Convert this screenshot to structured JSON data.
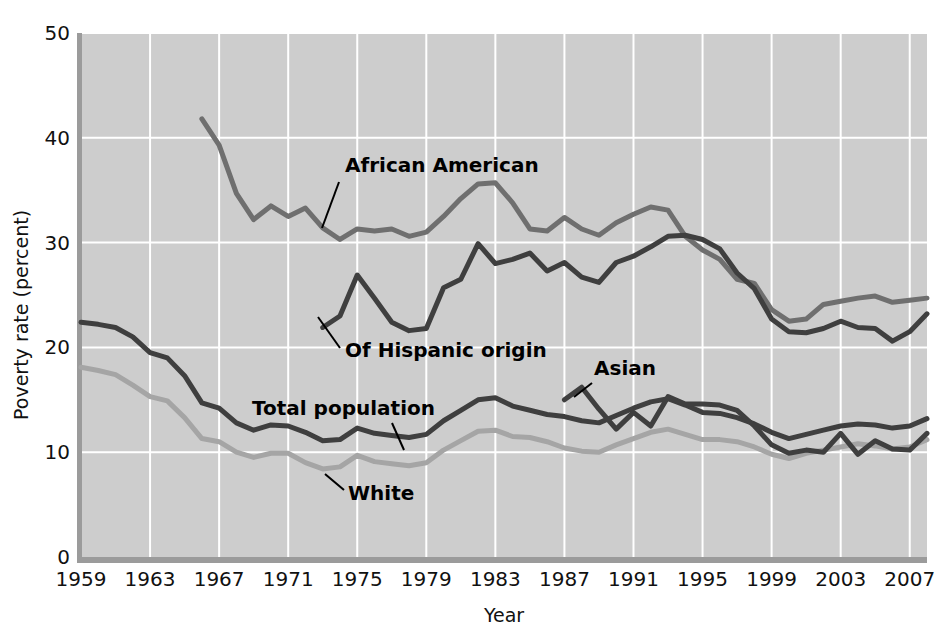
{
  "chart_data": {
    "type": "line",
    "title": "",
    "xlabel": "Year",
    "ylabel": "Poverty rate (percent)",
    "xlim": [
      1959,
      2008
    ],
    "ylim": [
      0,
      50
    ],
    "ytick_labels": [
      "0",
      "10",
      "20",
      "30",
      "40",
      "50"
    ],
    "yticks": [
      0,
      10,
      20,
      30,
      40,
      50
    ],
    "xtick_labels": [
      "1959",
      "1963",
      "1967",
      "1971",
      "1975",
      "1979",
      "1983",
      "1987",
      "1991",
      "1995",
      "1999",
      "2003",
      "2007"
    ],
    "xticks": [
      1959,
      1963,
      1967,
      1971,
      1975,
      1979,
      1983,
      1987,
      1991,
      1995,
      1999,
      2003,
      2007
    ],
    "grid": true,
    "grid_color": "#ffffff",
    "plot_background": "#cdcdcd",
    "legend_position": "inline-annotations",
    "series": [
      {
        "name": "African American",
        "color": "#6f6f6f",
        "label_text": "African American",
        "x": [
          1966,
          1967,
          1968,
          1969,
          1970,
          1971,
          1972,
          1973,
          1974,
          1975,
          1976,
          1977,
          1978,
          1979,
          1980,
          1981,
          1982,
          1983,
          1984,
          1985,
          1986,
          1987,
          1988,
          1989,
          1990,
          1991,
          1992,
          1993,
          1994,
          1995,
          1996,
          1997,
          1998,
          1999,
          2000,
          2001,
          2002,
          2003,
          2004,
          2005,
          2006,
          2007,
          2008
        ],
        "values": [
          41.8,
          39.3,
          34.7,
          32.2,
          33.5,
          32.5,
          33.3,
          31.4,
          30.3,
          31.3,
          31.1,
          31.3,
          30.6,
          31.0,
          32.5,
          34.2,
          35.6,
          35.7,
          33.8,
          31.3,
          31.1,
          32.4,
          31.3,
          30.7,
          31.9,
          32.7,
          33.4,
          33.1,
          30.6,
          29.3,
          28.4,
          26.5,
          26.1,
          23.6,
          22.5,
          22.7,
          24.1,
          24.4,
          24.7,
          24.9,
          24.3,
          24.5,
          24.7
        ]
      },
      {
        "name": "Of Hispanic origin",
        "color": "#3f3f3f",
        "label_text": "Of Hispanic origin",
        "x": [
          1973,
          1974,
          1975,
          1976,
          1977,
          1978,
          1979,
          1980,
          1981,
          1982,
          1983,
          1984,
          1985,
          1986,
          1987,
          1988,
          1989,
          1990,
          1991,
          1992,
          1993,
          1994,
          1995,
          1996,
          1997,
          1998,
          1999,
          2000,
          2001,
          2002,
          2003,
          2004,
          2005,
          2006,
          2007,
          2008
        ],
        "values": [
          21.9,
          23.0,
          26.9,
          24.7,
          22.4,
          21.6,
          21.8,
          25.7,
          26.5,
          29.9,
          28.0,
          28.4,
          29.0,
          27.3,
          28.1,
          26.7,
          26.2,
          28.1,
          28.7,
          29.6,
          30.6,
          30.7,
          30.3,
          29.4,
          27.1,
          25.6,
          22.7,
          21.5,
          21.4,
          21.8,
          22.5,
          21.9,
          21.8,
          20.6,
          21.5,
          23.2
        ]
      },
      {
        "name": "Total population",
        "color": "#3f3f3f",
        "label_text": "Total population",
        "x": [
          1959,
          1960,
          1961,
          1962,
          1963,
          1964,
          1965,
          1966,
          1967,
          1968,
          1969,
          1970,
          1971,
          1972,
          1973,
          1974,
          1975,
          1976,
          1977,
          1978,
          1979,
          1980,
          1981,
          1982,
          1983,
          1984,
          1985,
          1986,
          1987,
          1988,
          1989,
          1990,
          1991,
          1992,
          1993,
          1994,
          1995,
          1996,
          1997,
          1998,
          1999,
          2000,
          2001,
          2002,
          2003,
          2004,
          2005,
          2006,
          2007,
          2008
        ],
        "values": [
          22.4,
          22.2,
          21.9,
          21.0,
          19.5,
          19.0,
          17.3,
          14.7,
          14.2,
          12.8,
          12.1,
          12.6,
          12.5,
          11.9,
          11.1,
          11.2,
          12.3,
          11.8,
          11.6,
          11.4,
          11.7,
          13.0,
          14.0,
          15.0,
          15.2,
          14.4,
          14.0,
          13.6,
          13.4,
          13.0,
          12.8,
          13.5,
          14.2,
          14.8,
          15.1,
          14.5,
          13.8,
          13.7,
          13.3,
          12.7,
          11.9,
          11.3,
          11.7,
          12.1,
          12.5,
          12.7,
          12.6,
          12.3,
          12.5,
          13.2
        ]
      },
      {
        "name": "White",
        "color": "#a5a5a5",
        "label_text": "White",
        "x": [
          1959,
          1960,
          1961,
          1962,
          1963,
          1964,
          1965,
          1966,
          1967,
          1968,
          1969,
          1970,
          1971,
          1972,
          1973,
          1974,
          1975,
          1976,
          1977,
          1978,
          1979,
          1980,
          1981,
          1982,
          1983,
          1984,
          1985,
          1986,
          1987,
          1988,
          1989,
          1990,
          1991,
          1992,
          1993,
          1994,
          1995,
          1996,
          1997,
          1998,
          1999,
          2000,
          2001,
          2002,
          2003,
          2004,
          2005,
          2006,
          2007,
          2008
        ],
        "values": [
          18.1,
          17.8,
          17.4,
          16.4,
          15.3,
          14.9,
          13.3,
          11.3,
          11.0,
          10.0,
          9.5,
          9.9,
          9.9,
          9.0,
          8.4,
          8.6,
          9.7,
          9.1,
          8.9,
          8.7,
          9.0,
          10.2,
          11.1,
          12.0,
          12.1,
          11.5,
          11.4,
          11.0,
          10.4,
          10.1,
          10.0,
          10.7,
          11.3,
          11.9,
          12.2,
          11.7,
          11.2,
          11.2,
          11.0,
          10.5,
          9.8,
          9.4,
          9.9,
          10.2,
          10.5,
          10.8,
          10.6,
          10.3,
          10.5,
          11.2
        ]
      },
      {
        "name": "Asian",
        "color": "#3f3f3f",
        "label_text": "Asian",
        "x": [
          1987,
          1988,
          1989,
          1990,
          1991,
          1992,
          1993,
          1994,
          1995,
          1996,
          1997,
          1998,
          1999,
          2000,
          2001,
          2002,
          2003,
          2004,
          2005,
          2006,
          2007,
          2008
        ],
        "values": [
          15.0,
          16.2,
          14.1,
          12.2,
          13.8,
          12.5,
          15.3,
          14.6,
          14.6,
          14.5,
          14.0,
          12.5,
          10.7,
          9.9,
          10.2,
          10.0,
          11.8,
          9.8,
          11.1,
          10.3,
          10.2,
          11.8
        ]
      }
    ],
    "annotations": [
      {
        "name": "african-american-label",
        "text": "African American",
        "text_x": 345,
        "text_y": 172,
        "leader": {
          "x1": 339,
          "y1": 182,
          "x2": 322,
          "y2": 228
        }
      },
      {
        "name": "of-hispanic-origin-label",
        "text": "Of Hispanic origin",
        "text_x": 345,
        "text_y": 357,
        "leader": {
          "x1": 340,
          "y1": 348,
          "x2": 318,
          "y2": 317
        }
      },
      {
        "name": "total-population-label",
        "text": "Total population",
        "text_x": 252,
        "text_y": 415,
        "leader": {
          "x1": 392,
          "y1": 423,
          "x2": 404,
          "y2": 450
        }
      },
      {
        "name": "white-label",
        "text": "White",
        "text_x": 348,
        "text_y": 500,
        "leader": {
          "x1": 344,
          "y1": 490,
          "x2": 325,
          "y2": 474
        }
      },
      {
        "name": "asian-label",
        "text": "Asian",
        "text_x": 594,
        "text_y": 375,
        "leader": {
          "x1": 592,
          "y1": 383,
          "x2": 574,
          "y2": 397
        }
      }
    ]
  }
}
